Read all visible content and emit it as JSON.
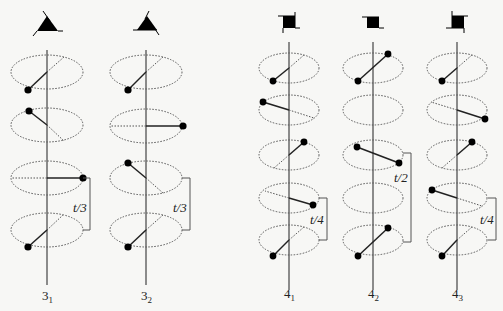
{
  "figure": {
    "columns": [
      {
        "id": "3_1",
        "label_main": "3",
        "label_sub": "1",
        "axis_x": 47,
        "symbol": "triangle",
        "ellipses": [
          {
            "cy": 72,
            "dot": [
              28,
              90
            ],
            "line": "diag"
          },
          {
            "cy": 125,
            "dot": [
              29,
              111
            ],
            "line": "diag-rev"
          },
          {
            "cy": 178,
            "dot": [
              83,
              178
            ],
            "line": "horiz"
          },
          {
            "cy": 230,
            "dot": [
              28,
              247
            ],
            "line": "diag"
          }
        ],
        "bracket": {
          "x": 90,
          "y1": 178,
          "y2": 230,
          "label": "t/3"
        }
      },
      {
        "id": "3_2",
        "label_main": "3",
        "label_sub": "2",
        "axis_x": 146,
        "symbol": "triangle",
        "ellipses": [
          {
            "cy": 72,
            "dot": [
              128,
              90
            ],
            "line": "diag"
          },
          {
            "cy": 126,
            "dot": [
              183,
              126
            ],
            "line": "horiz"
          },
          {
            "cy": 178,
            "dot": [
              128,
              163
            ],
            "line": "diag-rev"
          },
          {
            "cy": 230,
            "dot": [
              128,
              247
            ],
            "line": "diag"
          }
        ],
        "bracket": {
          "x": 190,
          "y1": 178,
          "y2": 230,
          "label": "t/3"
        }
      },
      {
        "id": "4_1",
        "label_main": "4",
        "label_sub": "1",
        "axis_x": 289,
        "symbol": "square",
        "ellipses": [
          {
            "cy": 68,
            "dot": [
              273,
              81
            ]
          },
          {
            "cy": 110,
            "dot": [
              263,
              102
            ]
          },
          {
            "cy": 155,
            "dot": [
              304,
              142
            ]
          },
          {
            "cy": 198,
            "dot": [
              313,
              205
            ]
          },
          {
            "cy": 240,
            "dot": [
              273,
              256
            ]
          }
        ],
        "bracket": {
          "x": 327,
          "y1": 198,
          "y2": 240,
          "label": "t/4"
        }
      },
      {
        "id": "4_2",
        "label_main": "4",
        "label_sub": "2",
        "axis_x": 373,
        "symbol": "square",
        "ellipses": [
          {
            "cy": 68,
            "dots": [
              [
                358,
                81
              ],
              [
                388,
                54
              ]
            ]
          },
          {
            "cy": 110,
            "dots": []
          },
          {
            "cy": 155,
            "dots": [
              [
                357,
                147
              ],
              [
                399,
                163
              ]
            ]
          },
          {
            "cy": 198,
            "dots": []
          },
          {
            "cy": 240,
            "dots": [
              [
                388,
                228
              ],
              [
                358,
                256
              ]
            ]
          }
        ],
        "bracket": {
          "x": 411,
          "y1": 155,
          "y2": 240,
          "label": "t/2"
        }
      },
      {
        "id": "4_3",
        "label_main": "4",
        "label_sub": "3",
        "axis_x": 457,
        "symbol": "square",
        "ellipses": [
          {
            "cy": 68,
            "dot": [
              442,
              81
            ]
          },
          {
            "cy": 110,
            "dot": [
              485,
              119
            ]
          },
          {
            "cy": 155,
            "dot": [
              472,
              142
            ]
          },
          {
            "cy": 198,
            "dot": [
              432,
              190
            ]
          },
          {
            "cy": 240,
            "dot": [
              442,
              256
            ]
          }
        ],
        "bracket": {
          "x": 496,
          "y1": 198,
          "y2": 240,
          "label": "t/4"
        }
      }
    ]
  },
  "labels": {
    "col_3_1": {
      "main": "3",
      "sub": "1"
    },
    "col_3_2": {
      "main": "3",
      "sub": "2"
    },
    "col_4_1": {
      "main": "4",
      "sub": "1"
    },
    "col_4_2": {
      "main": "4",
      "sub": "2"
    },
    "col_4_3": {
      "main": "4",
      "sub": "3"
    },
    "bracket_3_1": "t/3",
    "bracket_3_2": "t/3",
    "bracket_4_1": "t/4",
    "bracket_4_2": "t/2",
    "bracket_4_3": "t/4"
  }
}
